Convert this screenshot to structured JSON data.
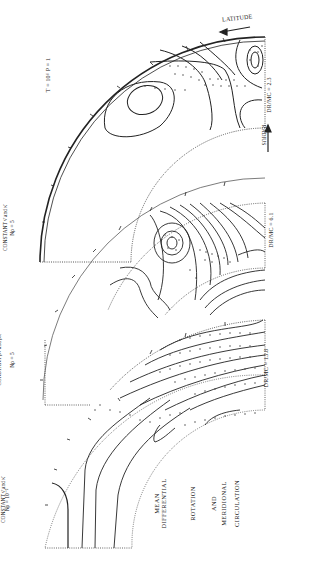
{
  "figure": {
    "title_lines": [
      "MEAN",
      "DIFFERENTIAL",
      "ROTATION",
      "AND",
      "MERIDIONAL",
      "CIRCULATION"
    ],
    "global_params": "T = 10⁶   P = 1",
    "axis_labels": {
      "latitude": "LATITUDE",
      "radius": "RADIUS"
    },
    "panels": [
      {
        "id": "panel-1",
        "condition_line1": "Nρ = 10⁻²",
        "condition_line2": "CONSTANT ν̄ and κ̄",
        "ratio_label": "DR/MC = 13.8"
      },
      {
        "id": "panel-2",
        "condition_line1": "Nρ = 5",
        "condition_line2": "CONSTANT ρ̄ν̄ and ρ̄κ̄",
        "ratio_label": "DR/MC = 6.1"
      },
      {
        "id": "panel-3",
        "condition_line1": "Nρ = 5",
        "condition_line2": "CONSTANT ν̄ and κ̄",
        "ratio_label": "DR/MC = 2.3"
      }
    ]
  },
  "colors": {
    "ink": "#222222",
    "background": "#ffffff",
    "dotted": "#555555"
  }
}
